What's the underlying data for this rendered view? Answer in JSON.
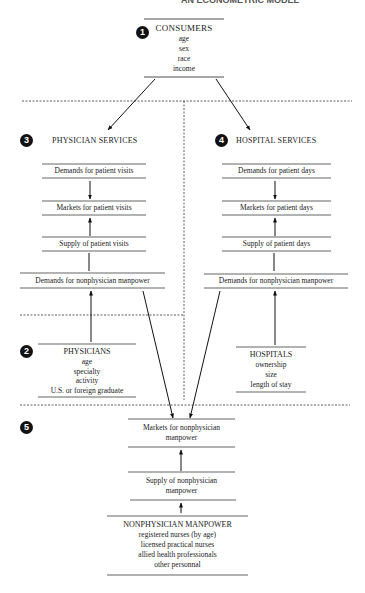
{
  "page_header_cut": "AN ECONOMETRIC MODEL",
  "sections": {
    "consumers": {
      "badge": "1",
      "title": "CONSUMERS",
      "attributes": [
        "age",
        "sex",
        "race",
        "income"
      ]
    },
    "physicians": {
      "badge": "2",
      "title": "PHYSICIANS",
      "attributes": [
        "age",
        "specialty",
        "activity",
        "U.S. or foreign graduate"
      ]
    },
    "physician_services": {
      "badge": "3",
      "title": "PHYSICIAN SERVICES",
      "boxes": [
        "Demands for patient visits",
        "Markets for patient visits",
        "Supply of patient visits",
        "Demands for nonphysician manpower"
      ]
    },
    "hospital_services": {
      "badge": "4",
      "title": "HOSPITAL SERVICES",
      "boxes": [
        "Demands for patient days",
        "Markets for patient days",
        "Supply of patient days",
        "Demands for nonphysician manpower"
      ]
    },
    "hospitals": {
      "title": "HOSPITALS",
      "attributes": [
        "ownership",
        "size",
        "length of stay"
      ]
    },
    "nonphysician": {
      "badge": "5",
      "markets_line1": "Markets for nonphysician",
      "markets_line2": "manpower",
      "supply_line1": "Supply of nonphysician",
      "supply_line2": "manpower",
      "title": "NONPHYSICIAN MANPOWER",
      "attributes": [
        "registered nurses (by age)",
        "licensed practical nurses",
        "allied health professionals",
        "other personnal"
      ]
    }
  }
}
